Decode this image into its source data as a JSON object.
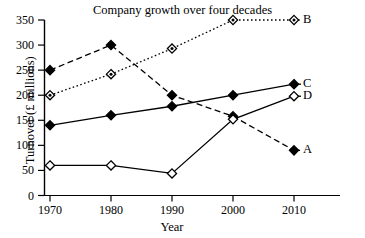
{
  "chart_data": {
    "type": "line",
    "title": "Company growth over four decades",
    "xlabel": "Year",
    "ylabel": "Turnover (£ millions)",
    "categories": [
      "1970",
      "1980",
      "1990",
      "2000",
      "2010"
    ],
    "x": [
      1970,
      1980,
      1990,
      2000,
      2010
    ],
    "xlim": [
      1965,
      2015
    ],
    "ylim": [
      0,
      350
    ],
    "y_ticks": [
      "0",
      "50",
      "100",
      "150",
      "200",
      "250",
      "300",
      "350"
    ],
    "x_ticks": [
      "1970",
      "1980",
      "1990",
      "2000",
      "2010"
    ],
    "grid": false,
    "legend_position": "right-of-line-ends",
    "series": [
      {
        "name": "A",
        "label": "A",
        "values": [
          250,
          300,
          200,
          158,
          90
        ],
        "line_style": "dashed",
        "marker": "filled-diamond",
        "color": "#000000"
      },
      {
        "name": "B",
        "label": "B",
        "values": [
          200,
          242,
          293,
          350,
          350
        ],
        "line_style": "dotted",
        "marker": "open-diamond-dot",
        "color": "#000000"
      },
      {
        "name": "C",
        "label": "C",
        "values": [
          140,
          160,
          178,
          200,
          222
        ],
        "line_style": "solid",
        "marker": "filled-diamond",
        "color": "#000000"
      },
      {
        "name": "D",
        "label": "D",
        "values": [
          60,
          60,
          44,
          152,
          198
        ],
        "line_style": "solid",
        "marker": "open-diamond",
        "color": "#000000"
      }
    ]
  }
}
